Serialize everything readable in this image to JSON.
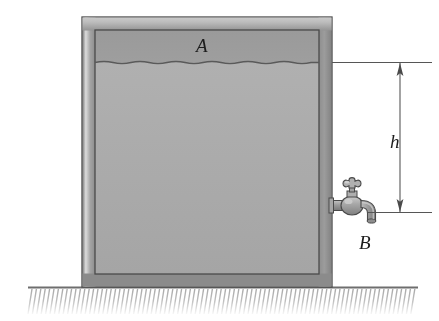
{
  "figure": {
    "type": "physics-diagram",
    "width": 439,
    "height": 321,
    "background_color": "#ffffff"
  },
  "labels": {
    "point_a": "A",
    "point_b": "B",
    "height": "h"
  },
  "annotations": {
    "point_a_meaning": "water free surface inside tank",
    "point_b_meaning": "faucet outlet",
    "height_meaning": "vertical distance from free surface to faucet"
  },
  "dimension": {
    "name": "h",
    "top_y": 62,
    "bottom_y": 212,
    "line_x": 400,
    "arrow_style": "double-ended",
    "extension_top_from_x": 332,
    "extension_top_to_x": 432,
    "extension_bottom_from_x": 368,
    "extension_bottom_to_x": 432
  },
  "tank": {
    "outer_left": 82,
    "outer_right": 332,
    "outer_top": 17,
    "outer_bottom": 287,
    "wall_thickness": 13,
    "wall_color": "#8f8f8f",
    "wall_highlight_color": "#d8d8d8",
    "rim_color": "#b4b4b4",
    "outline_color": "#4a4a4a",
    "air_color": "#9b9b9b",
    "water_color": "#ababab",
    "water_surface_y": 62
  },
  "faucet": {
    "attach_x": 332,
    "attach_y": 205,
    "body_color": "#9a9a9a",
    "highlight_color": "#c8c8c8",
    "outline_color": "#4a4a4a",
    "parts": [
      "cross-handle",
      "stem",
      "packing-nut",
      "bulb-body",
      "inlet-pipe",
      "curved-spout"
    ]
  },
  "ground": {
    "line_y": 287,
    "line_from_x": 28,
    "line_to_x": 418,
    "line_color": "#6e6e6e",
    "hatch_color": "#b0b0b0",
    "hatch_count": 90,
    "hatch_depth": 26
  },
  "colors": {
    "outline": "#4a4a4a",
    "wall": "#8f8f8f",
    "water": "#ababab",
    "air": "#9b9b9b",
    "metal": "#9a9a9a",
    "ground_hatch": "#b0b0b0",
    "label_text": "#1d1d1d"
  }
}
